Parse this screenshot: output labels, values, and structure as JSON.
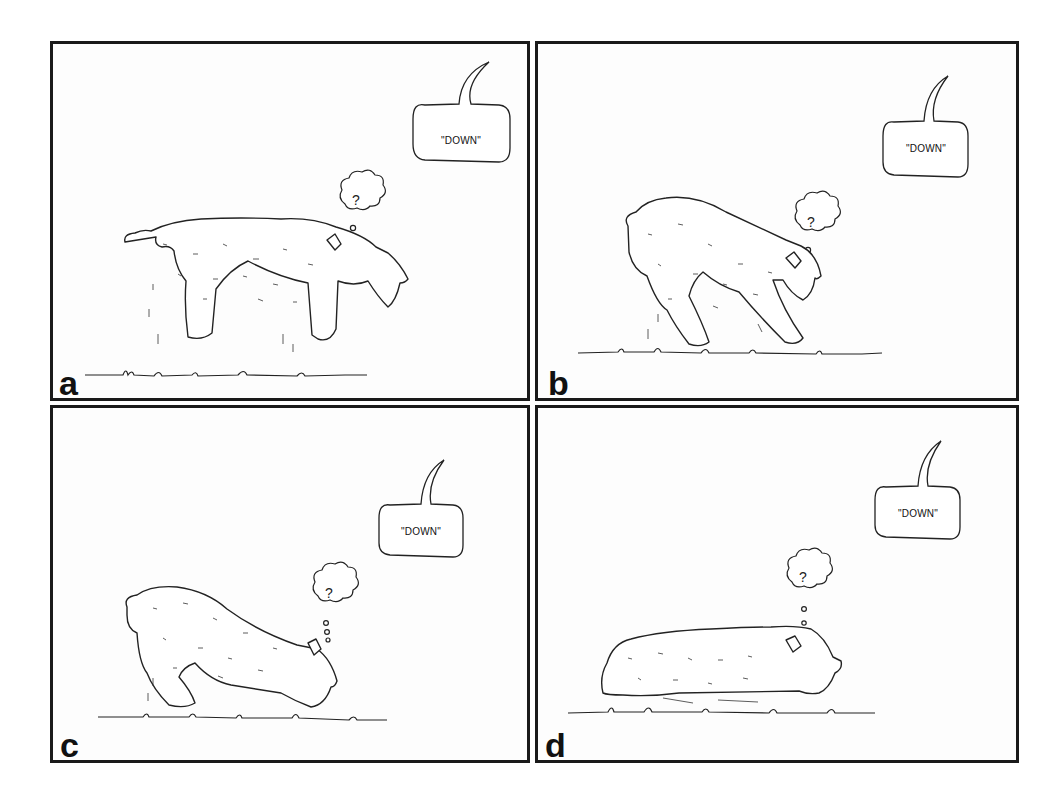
{
  "figure": {
    "panels": [
      {
        "id": "a",
        "label": "a",
        "speech": "\"DOWN\"",
        "thought": "?",
        "pose": "standing"
      },
      {
        "id": "b",
        "label": "b",
        "speech": "\"DOWN\"",
        "thought": "?",
        "pose": "front-lowered"
      },
      {
        "id": "c",
        "label": "c",
        "speech": "\"DOWN\"",
        "thought": "?",
        "pose": "crouching"
      },
      {
        "id": "d",
        "label": "d",
        "speech": "\"DOWN\"",
        "thought": "?",
        "pose": "lying-down"
      }
    ],
    "colors": {
      "ink": "#1a1a1a",
      "paper": "#fdfdfd"
    }
  }
}
